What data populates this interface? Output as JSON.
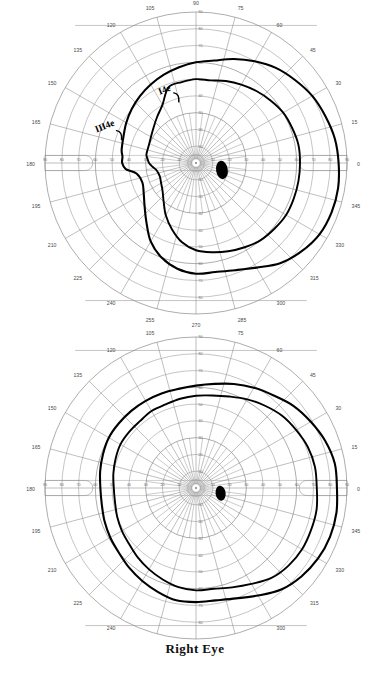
{
  "document": {
    "type": "goldmann-kinetic-perimetry",
    "caption": "Right Eye"
  },
  "axis": {
    "meridian_labels": [
      "0",
      "15",
      "30",
      "45",
      "60",
      "75",
      "90",
      "105",
      "120",
      "135",
      "150",
      "165",
      "180",
      "195",
      "210",
      "225",
      "240",
      "255",
      "270",
      "285",
      "300",
      "315",
      "330",
      "345"
    ],
    "radial_labels": [
      "10",
      "20",
      "30",
      "40",
      "50",
      "60",
      "70",
      "80",
      "90"
    ],
    "horizontal_labels_left": [
      "90",
      "80",
      "70",
      "60",
      "50",
      "40",
      "30",
      "20",
      "10"
    ],
    "horizontal_labels_right": [
      "10",
      "20",
      "30",
      "40",
      "50",
      "60",
      "70",
      "80",
      "90"
    ],
    "grid_color": "#8a8a8a",
    "isopter_color": "#000000",
    "blindspot_color": "#000000"
  },
  "annotations": {
    "isopter_outer_label": "III4e",
    "isopter_inner_label": "I4e"
  },
  "chart_data": [
    {
      "type": "line",
      "id": "top-field",
      "title": "",
      "subtitle": "",
      "xlabel": "",
      "ylabel": "",
      "coordinate_system": "polar-degrees",
      "radial_range": [
        0,
        90
      ],
      "grid": true,
      "legend_position": "inline-handwritten",
      "annotations": [
        {
          "text": "III4e",
          "angle": 163,
          "radius": 62
        },
        {
          "text": "I4e",
          "angle": 118,
          "radius": 46
        }
      ],
      "blind_spot": {
        "angle": 345,
        "radius": 16,
        "width_deg": 7,
        "height_deg": 11
      },
      "series": [
        {
          "name": "III4e",
          "angles": [
            0,
            10,
            20,
            30,
            40,
            50,
            60,
            70,
            80,
            90,
            100,
            110,
            120,
            130,
            140,
            150,
            160,
            170,
            175,
            180,
            185,
            190,
            200,
            210,
            220,
            230,
            240,
            250,
            260,
            270,
            280,
            290,
            300,
            310,
            320,
            330,
            340,
            350
          ],
          "values": [
            85,
            84,
            82,
            80,
            77,
            74,
            70,
            66,
            62,
            60,
            58,
            56,
            54,
            52,
            50,
            48,
            46,
            45,
            44,
            44,
            42,
            36,
            34,
            36,
            40,
            46,
            54,
            60,
            64,
            66,
            66,
            68,
            72,
            78,
            82,
            85,
            86,
            86
          ]
        },
        {
          "name": "I4e",
          "angles": [
            0,
            10,
            20,
            30,
            40,
            50,
            60,
            70,
            80,
            90,
            100,
            110,
            120,
            130,
            140,
            150,
            160,
            170,
            175,
            180,
            185,
            190,
            200,
            210,
            220,
            230,
            240,
            250,
            260,
            270,
            280,
            290,
            300,
            310,
            320,
            330,
            340,
            350
          ],
          "values": [
            62,
            62,
            61,
            60,
            58,
            56,
            54,
            52,
            50,
            50,
            49,
            48,
            40,
            36,
            33,
            31,
            30,
            30,
            29,
            28,
            26,
            24,
            23,
            24,
            26,
            30,
            36,
            42,
            48,
            52,
            54,
            56,
            58,
            60,
            61,
            62,
            62,
            62
          ]
        }
      ]
    },
    {
      "type": "line",
      "id": "bottom-field",
      "title": "",
      "subtitle": "Right Eye",
      "xlabel": "",
      "ylabel": "",
      "coordinate_system": "polar-degrees",
      "radial_range": [
        0,
        90
      ],
      "grid": true,
      "legend_position": "none",
      "annotations": [],
      "blind_spot": {
        "angle": 348,
        "radius": 15,
        "width_deg": 6,
        "height_deg": 9
      },
      "series": [
        {
          "name": "III4e",
          "angles": [
            0,
            10,
            20,
            30,
            40,
            50,
            60,
            70,
            80,
            90,
            100,
            110,
            120,
            130,
            140,
            150,
            160,
            170,
            180,
            190,
            200,
            210,
            220,
            230,
            240,
            250,
            260,
            270,
            280,
            290,
            300,
            310,
            320,
            330,
            340,
            350
          ],
          "values": [
            84,
            84,
            82,
            79,
            76,
            72,
            69,
            66,
            63,
            61,
            60,
            60,
            60,
            60,
            60,
            60,
            59,
            58,
            57,
            57,
            58,
            59,
            60,
            62,
            64,
            66,
            68,
            68,
            68,
            70,
            74,
            79,
            82,
            84,
            85,
            85
          ]
        },
        {
          "name": "I4e",
          "angles": [
            0,
            10,
            20,
            30,
            40,
            50,
            60,
            70,
            80,
            90,
            100,
            110,
            120,
            130,
            140,
            150,
            160,
            170,
            180,
            190,
            200,
            210,
            220,
            230,
            240,
            250,
            260,
            270,
            280,
            290,
            300,
            310,
            320,
            330,
            340,
            350
          ],
          "values": [
            72,
            72,
            71,
            69,
            67,
            64,
            61,
            58,
            56,
            55,
            54,
            53,
            53,
            52,
            52,
            52,
            51,
            50,
            49,
            49,
            50,
            51,
            52,
            54,
            56,
            58,
            60,
            61,
            61,
            63,
            66,
            70,
            72,
            73,
            73,
            73
          ]
        }
      ]
    }
  ]
}
